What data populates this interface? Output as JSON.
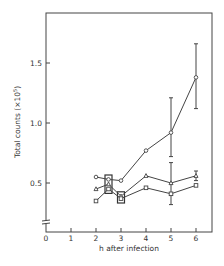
{
  "chart_data": {
    "type": "line",
    "title": "",
    "xlabel": "h after infection",
    "ylabel": "Total counts (×10⁵)",
    "xlim": [
      0,
      6.6
    ],
    "ylim": [
      0.12,
      1.9
    ],
    "y_axis_break": true,
    "grid": false,
    "legend": null,
    "x_ticks": [
      0,
      1,
      2,
      3,
      4,
      5,
      6
    ],
    "x_tick_labels": [
      "0",
      "1",
      "2",
      "3",
      "4",
      "5",
      "6"
    ],
    "y_ticks": [
      0.5,
      1.0,
      1.5
    ],
    "y_tick_labels": [
      "0.5",
      "1.0",
      "1.5"
    ],
    "series": [
      {
        "name": "circles",
        "marker": "circle",
        "x": [
          2,
          2.5,
          3,
          4,
          5,
          6
        ],
        "values": [
          0.55,
          0.53,
          0.52,
          0.77,
          0.92,
          1.38
        ],
        "error_bars": [
          null,
          null,
          null,
          null,
          [
            0.72,
            1.21
          ],
          [
            1.12,
            1.66
          ]
        ]
      },
      {
        "name": "triangles",
        "marker": "triangle",
        "x": [
          2,
          2.5,
          3,
          4,
          5,
          6
        ],
        "values": [
          0.45,
          0.49,
          0.39,
          0.56,
          0.5,
          0.56
        ],
        "error_bars": [
          null,
          null,
          null,
          null,
          [
            0.32,
            0.67
          ],
          [
            0.52,
            0.6
          ]
        ]
      },
      {
        "name": "squares",
        "marker": "square",
        "x": [
          2,
          2.5,
          3,
          4,
          5,
          6
        ],
        "values": [
          0.35,
          0.45,
          0.37,
          0.46,
          0.41,
          0.48
        ],
        "error_bars": [
          null,
          null,
          null,
          null,
          null,
          null
        ]
      }
    ],
    "annotations": [
      "boxed data cluster at 2.5 h",
      "boxed data cluster at 3 h"
    ]
  },
  "labels": {
    "xlabel": "h after infection",
    "ylabel_main": "Total counts (×10",
    "ylabel_exp": "5",
    "ylabel_end": ")"
  }
}
